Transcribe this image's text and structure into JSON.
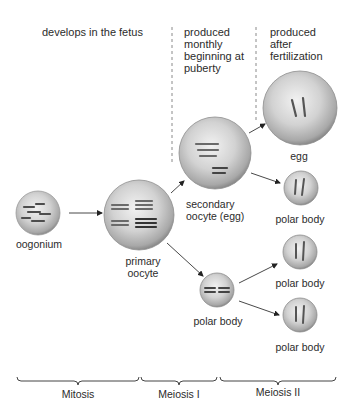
{
  "headers": {
    "fetus": "develops in the fetus",
    "puberty": "produced\nmonthly\nbeginning at\npuberty",
    "fertilization": "produced\nafter\nfertilization"
  },
  "cells": {
    "oogonium": "oogonium",
    "primary_oocyte": "primary\noocyte",
    "secondary_oocyte": "secondary\noocyte (egg)",
    "egg": "egg",
    "polar_body_1": "polar body",
    "polar_body_2": "polar body",
    "polar_body_3": "polar body",
    "polar_body_4": "polar body"
  },
  "stages": {
    "mitosis": "Mitosis",
    "meiosis_1": "Meiosis I",
    "meiosis_2": "Meiosis II"
  },
  "colors": {
    "cell_fill": "#c9c9c9",
    "cell_edge": "#8e8e8e",
    "chromosome": "#5a5a5a",
    "line": "#333333",
    "dashed": "#888888"
  }
}
